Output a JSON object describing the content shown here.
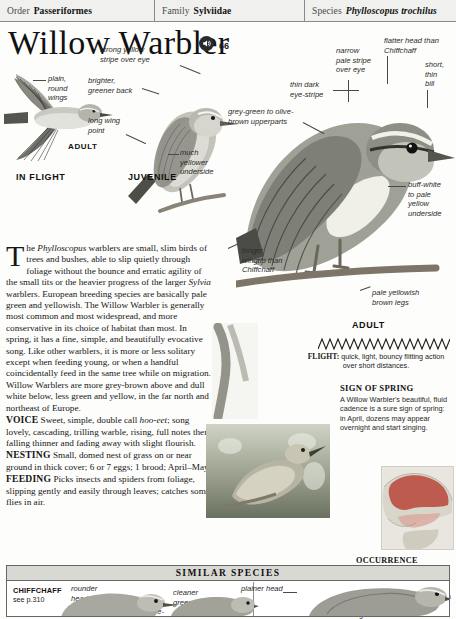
{
  "taxonomy": {
    "order_label": "Order",
    "order_value": "Passeriformes",
    "family_label": "Family",
    "family_value": "Sylviidae",
    "species_label": "Species",
    "species_value": "Phylloscopus trochilus"
  },
  "header": {
    "title": "Willow Warbler",
    "audio_icon": "speaker-icon",
    "audio_track": "66"
  },
  "plates": {
    "in_flight_label": "IN FLIGHT",
    "in_flight_age": "ADULT",
    "juvenile_label": "JUVENILE",
    "adult_label": "ADULT",
    "callouts": [
      {
        "name": "plain-round-wings",
        "text": "plain,\nround\nwings"
      },
      {
        "name": "strong-yellow-stripe",
        "text": "strong yellow\nstripe over eye"
      },
      {
        "name": "brighter-greener-back",
        "text": "brighter,\ngreener back"
      },
      {
        "name": "long-wing-point",
        "text": "long wing\npoint"
      },
      {
        "name": "much-yellower-underside",
        "text": "much\nyellower\nunderside"
      },
      {
        "name": "grey-green-upperparts",
        "text": "grey-green to olive-\nbrown upperparts"
      },
      {
        "name": "narrow-pale-stripe",
        "text": "narrow\npale stripe\nover eye"
      },
      {
        "name": "flatter-head",
        "text": "flatter head than\nChiffchaff"
      },
      {
        "name": "short-thin-bill",
        "text": "short,\nthin\nbill"
      },
      {
        "name": "thin-dark-eye-stripe",
        "text": "thin dark\neye-stripe"
      },
      {
        "name": "buff-white-underside",
        "text": "buff-white\nto pale\nyellow\nunderside"
      },
      {
        "name": "pale-yellowish-brown-legs",
        "text": "pale yellowish\nbrown legs"
      },
      {
        "name": "longer-wingtip",
        "text": "longer\nwingtip than\nChiffchaff"
      }
    ]
  },
  "description": {
    "dropcap": "T",
    "intro_a": "he ",
    "intro_italic_1": "Phylloscopus",
    "intro_b": " warblers are small, slim birds of trees and bushes, able to slip quietly through foliage without the bounce and erratic agility of the small tits or the heavier progress of the larger ",
    "intro_italic_2": "Sylvia",
    "intro_c": " warblers. European breeding species are basically pale green and yellowish. The Willow Warbler is generally most common and most widespread, and more conservative in its choice of habitat than most. In spring, it has a fine, simple, and beautifully evocative song. Like other warblers, it is more or less solitary except when feeding young, or when a handful coincidentally feed in the same tree while on migration. Willow Warblers are more grey-brown above and dull white below, less green and yellow, in the far north and northeast of Europe.",
    "voice_label": "VOICE",
    "voice_a": " Sweet, simple, double call ",
    "voice_italic": "hoo-eet",
    "voice_b": "; song lovely, cascading, trilling warble, rising, full notes then falling thinner and fading away with slight flourish.",
    "nesting_label": "NESTING",
    "nesting_text": " Small, domed nest of grass on or near ground in thick cover; 6 or 7 eggs; 1 brood; April–May.",
    "feeding_label": "FEEDING",
    "feeding_text": " Picks insects and spiders from foliage, slipping gently and easily through leaves; catches some flies in air."
  },
  "flight": {
    "sonogram_icon": "zigzag-sonogram",
    "label": "FLIGHT:",
    "text": " quick, light, bouncy flitting action over short distances."
  },
  "sign_of_spring": {
    "heading": "SIGN OF SPRING",
    "text": "A Willow Warbler's beautiful, fluid cadence is a sure sign of spring: in April, dozens may appear overnight and start singing."
  },
  "occurrence": {
    "heading": "OCCURRENCE",
    "text": "Breeds everywhere north from mid-France and C Europe except for Iceland. Present from April to October; common migrant in S Europe. Prefers light woodland"
  },
  "similar_species": {
    "heading": "SIMILAR SPECIES",
    "name": "CHIFFCHAFF",
    "page_ref": "see p.310",
    "callouts": [
      {
        "name": "rounder-head",
        "text": "rounder\nhead"
      },
      {
        "name": "thin-eye-ring",
        "text": "thin eye-"
      },
      {
        "name": "cleaner-green",
        "text": "cleaner\ngreen"
      },
      {
        "name": "plainer-head",
        "text": "plainer head"
      }
    ]
  },
  "colors": {
    "rule": "#7a7a7a",
    "bar_bg": "#f0f0ee",
    "sim_head_bg": "#d9d9d3",
    "map_land": "#d8d5ca",
    "map_range": "#b9453a",
    "map_sea": "#e8e6df"
  }
}
